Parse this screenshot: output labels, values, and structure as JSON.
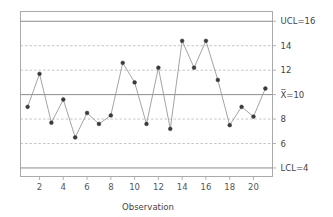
{
  "chart_data": {
    "type": "line",
    "title": "",
    "subtitle": "",
    "xlabel": "Observation",
    "ylabel": "",
    "x": [
      1,
      2,
      3,
      4,
      5,
      6,
      7,
      8,
      9,
      10,
      11,
      12,
      13,
      14,
      15,
      16,
      17,
      18,
      19,
      20,
      21
    ],
    "values": [
      9.0,
      11.7,
      7.7,
      9.6,
      6.5,
      8.5,
      7.6,
      8.3,
      12.6,
      11.0,
      7.6,
      12.2,
      7.2,
      14.4,
      12.2,
      14.4,
      11.2,
      7.5,
      9.0,
      8.2,
      10.5
    ],
    "series": [
      {
        "name": "Individual Value",
        "values": [
          9.0,
          11.7,
          7.7,
          9.6,
          6.5,
          8.5,
          7.6,
          8.3,
          12.6,
          11.0,
          7.6,
          12.2,
          7.2,
          14.4,
          12.2,
          14.4,
          11.2,
          7.5,
          9.0,
          8.2,
          10.5
        ]
      }
    ],
    "xlim": [
      0.4,
      21.6
    ],
    "ylim": [
      3.3,
      16.8
    ],
    "xticks": [
      2,
      4,
      6,
      8,
      10,
      12,
      14,
      16,
      18,
      20
    ],
    "xticklabels": [
      "2",
      "4",
      "6",
      "8",
      "10",
      "12",
      "14",
      "16",
      "18",
      "20"
    ],
    "yticks": [
      4,
      6,
      8,
      10,
      12,
      14,
      16
    ],
    "yticklabels": [
      "LCL=4",
      "6",
      "8",
      "X̅4=10",
      "12",
      "14",
      "UCL=16"
    ],
    "grid": true,
    "grid_style": "dashed",
    "legend": "none",
    "control_limits": {
      "ucl": 16,
      "center": 10,
      "lcl": 4,
      "ucl_label": "UCL=16",
      "center_label": "X̅=10",
      "lcl_label": "LCL=4"
    },
    "gridline_values": [
      6,
      8,
      12,
      14
    ],
    "gridline_labels": [
      "6",
      "8",
      "12",
      "14"
    ],
    "colors": {
      "line": "#9a9a9a",
      "marker": "#3a3a3a",
      "limit_line": "#8c8c8c",
      "center_line": "#8c8c8c",
      "grid": "#b8b8b8",
      "frame": "#aaaaaa",
      "background": "#ffffff",
      "text": "#444444"
    }
  },
  "axis_title": "Observation",
  "right_labels": [
    {
      "value": 16,
      "text": "UCL=16"
    },
    {
      "value": 14,
      "text": "14"
    },
    {
      "value": 12,
      "text": "12"
    },
    {
      "value": 10,
      "text": "X̅=10"
    },
    {
      "value": 8,
      "text": "8"
    },
    {
      "value": 6,
      "text": "6"
    },
    {
      "value": 4,
      "text": "LCL=4"
    }
  ]
}
